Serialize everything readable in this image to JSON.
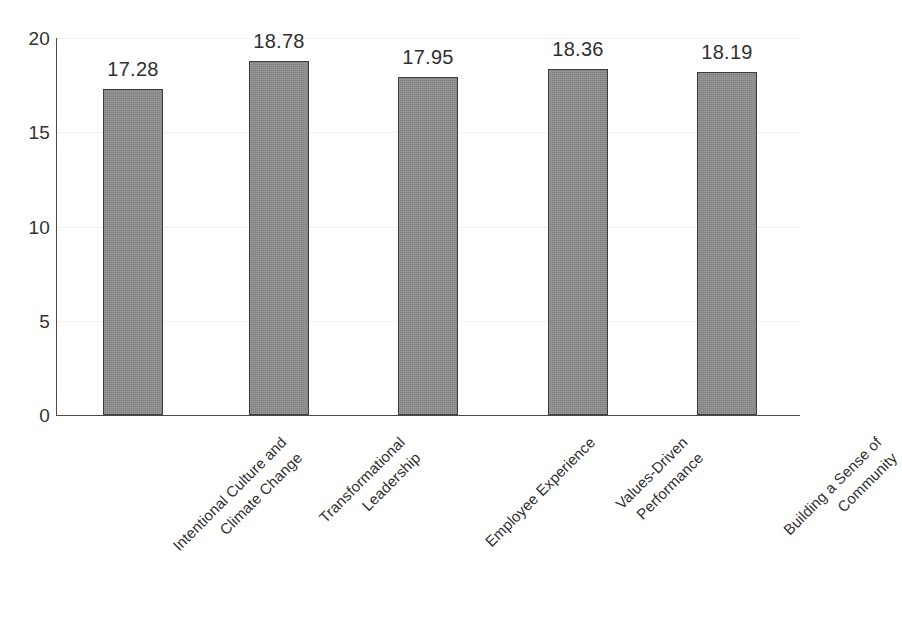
{
  "chart_data": {
    "type": "bar",
    "title": "",
    "subtitle": "",
    "xlabel": "",
    "ylabel": "",
    "categories": [
      "Intentional Culture and Climate Change",
      "Transformational Leadership",
      "Employee Experience",
      "Values-Driven Performance",
      "Building a Sense of Community"
    ],
    "category_lines": [
      [
        "Intentional Culture and",
        "Climate Change"
      ],
      [
        "Transformational",
        "Leadership"
      ],
      [
        "Employee Experience"
      ],
      [
        "Values-Driven",
        "Performance"
      ],
      [
        "Building a Sense of",
        "Community"
      ]
    ],
    "values": [
      17.28,
      18.78,
      17.95,
      18.36,
      18.19
    ],
    "value_labels": [
      "17.28",
      "18.78",
      "17.95",
      "18.36",
      "18.19"
    ],
    "ylim": [
      0,
      20
    ],
    "yticks": [
      0,
      5,
      10,
      15,
      20
    ],
    "ytick_labels": [
      "0",
      "5",
      "10",
      "15",
      "20"
    ],
    "grid": true,
    "legend": false,
    "legend_position": "none",
    "bar_fill_color": "#8d8d8d",
    "bar_border_color": "#3d3d3d",
    "axis_color": "#4a4a4a",
    "gridline_color": "#f1f1f1",
    "text_color": "#2f2f2f",
    "background_color": "#ffffff",
    "label_rotation_degrees": -45
  }
}
